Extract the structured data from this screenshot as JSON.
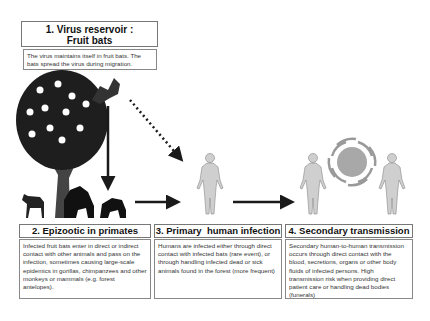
{
  "stage1": {
    "title_line1": "1. Virus reservoir :",
    "title_line2": "Fruit bats",
    "description": "The virus maintains itself in fruit bats. The bats spread the virus during migration."
  },
  "stage2": {
    "title": "2. Epizootic in primates",
    "description": "Infected fruit bats enter in direct or indirect contact with other animals and pass on the infection, sometimes causing large-scale epidemics in gorillas, chimpanzees and other monkeys or mammals (e.g. forest antelopes)."
  },
  "stage3": {
    "title": "3. Primary  human infection",
    "description": "Humans are infected either through direct contact with infected bats (rare event), or through handling infected dead or sick animals found in the forest (more frequent)"
  },
  "stage4": {
    "title": "4. Secondary transmission",
    "description": "Secondary human-to-human transmission occurs through direct contact with the blood, secretions, organs or other body fluids of infected persons. High transmission risk when providing direct patient care or handling dead bodies (funerals)"
  },
  "icons": [
    "fruit-tree-icon",
    "bat-icon",
    "antelope-icon",
    "gorilla-icon",
    "chimpanzee-icon",
    "human-figure-icon",
    "virus-icon",
    "arrow-icon",
    "dotted-arrow-icon"
  ],
  "colors": {
    "arrow": "#1a1a1a",
    "human": "#c8c8c8",
    "virus": "#a8a8a8",
    "border": "#777777"
  }
}
